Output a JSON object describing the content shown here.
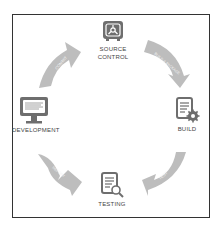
{
  "diagram": {
    "type": "cycle",
    "nodes": [
      {
        "id": "source-control",
        "label_line1": "SOURCE",
        "label_line2": "CONTROL",
        "icon": "vault-icon"
      },
      {
        "id": "build",
        "label": "BUILD",
        "icon": "document-gear-icon"
      },
      {
        "id": "testing",
        "label": "TESTING",
        "icon": "document-magnifier-icon"
      },
      {
        "id": "development",
        "label": "DEVELOPMENT",
        "icon": "monitor-icon"
      }
    ],
    "arrows": [
      {
        "from": "development",
        "to": "source-control",
        "label": "COMMIT"
      },
      {
        "from": "source-control",
        "to": "build",
        "label": "BUILD & PACKAGE"
      },
      {
        "from": "build",
        "to": "testing",
        "label": "TEST"
      },
      {
        "from": "testing",
        "to": "development",
        "label": "REPORT"
      }
    ],
    "colors": {
      "icon": "#6e6e6e",
      "arrow": "#bdbdbd",
      "frame": "#333333",
      "text": "#444444"
    }
  }
}
